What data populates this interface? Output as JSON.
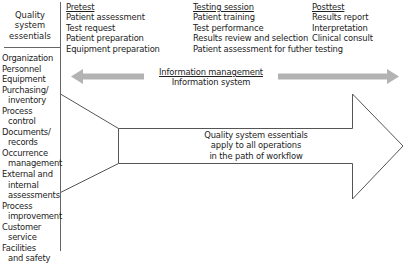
{
  "left_panel": {
    "title_lines": [
      "Quality",
      "system",
      "essentials"
    ],
    "items": [
      {
        "lines": [
          "Organization"
        ]
      },
      {
        "lines": [
          "Personnel"
        ]
      },
      {
        "lines": [
          "Equipment"
        ]
      },
      {
        "lines": [
          "Purchasing/",
          "inventory"
        ]
      },
      {
        "lines": [
          "Process",
          "control"
        ]
      },
      {
        "lines": [
          "Documents/",
          "records"
        ]
      },
      {
        "lines": [
          "Occurrence",
          "management"
        ]
      },
      {
        "lines": [
          "External and",
          "internal",
          "assessments"
        ]
      },
      {
        "lines": [
          "Process",
          "improvement"
        ]
      },
      {
        "lines": [
          "Customer",
          "service"
        ]
      },
      {
        "lines": [
          "Facilities",
          "and safety"
        ]
      }
    ]
  },
  "phases": [
    {
      "title": "Pretest",
      "items": [
        "Patient assessment",
        "Test request",
        "Patient preparation",
        "Equipment preparation"
      ]
    },
    {
      "title": "Testing session",
      "items": [
        "Patient training",
        "Test performance",
        "Results review and selection",
        "Patient assessment for futher testing"
      ]
    },
    {
      "title": "Posttest",
      "items": [
        "Results report",
        "Interpretation",
        "Clinical consult"
      ]
    }
  ],
  "information": {
    "title": "Information management",
    "subtitle": "Information system"
  },
  "workflow_arrow": {
    "lines": [
      "Quality system essentials",
      "apply to all operations",
      "in the path of workflow"
    ]
  },
  "colors": {
    "gray_arrow": "#b3b3b3",
    "outline": "#555555",
    "text": "#222222"
  }
}
